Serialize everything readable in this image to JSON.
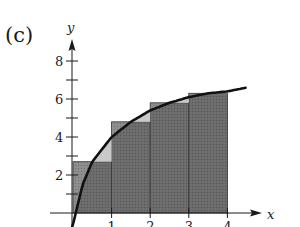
{
  "panel_label": "(c)",
  "colors": {
    "rect_under_curve": "#6a6a6a",
    "rect_above_curve": "#8c8c8c",
    "curve_above_rect": "#c9c9c9",
    "curve": "#111111",
    "axis": "#1a1a1a"
  },
  "chart_data": {
    "type": "area",
    "title": "(c)",
    "xlabel": "x",
    "ylabel": "y",
    "x_ticks": [
      1,
      2,
      3,
      4
    ],
    "y_ticks": [
      2,
      4,
      6,
      8
    ],
    "y_minor_ticks": [
      1,
      3,
      5,
      7
    ],
    "xlim": [
      0,
      4.5
    ],
    "ylim": [
      0,
      8.5
    ],
    "grid": false,
    "curve": {
      "x": [
        0.0,
        0.25,
        0.5,
        1.0,
        1.5,
        2.0,
        2.5,
        3.0,
        3.5,
        4.0,
        4.5
      ],
      "y": [
        -0.6,
        1.5,
        2.7,
        4.0,
        4.8,
        5.4,
        5.8,
        6.1,
        6.3,
        6.4,
        6.6
      ]
    },
    "rectangles": [
      {
        "x_start": 0,
        "x_end": 1,
        "height": 2.7
      },
      {
        "x_start": 1,
        "x_end": 2,
        "height": 4.8
      },
      {
        "x_start": 2,
        "x_end": 3,
        "height": 5.8
      },
      {
        "x_start": 3,
        "x_end": 4,
        "height": 6.3
      }
    ]
  }
}
